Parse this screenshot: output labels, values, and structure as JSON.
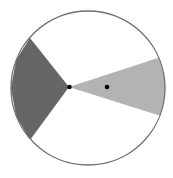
{
  "diagram": {
    "type": "circle-with-shaded-sectors",
    "colors": {
      "background": "#ffffff",
      "circle_stroke": "#6e6e6e",
      "dark_sector": "#666666",
      "light_sector": "#b3b3b3",
      "points": "#000000"
    },
    "circle": {
      "cx": 88,
      "cy": 88,
      "r": 77
    },
    "dark_sector": {
      "points": "69,87 30,38 16,60 11,88 16,116 30,140"
    },
    "light_sector": {
      "points": "69,87 164,56 166,75 166,98 164,117"
    },
    "points": [
      {
        "name": "vertex-point",
        "cx": 69.5,
        "cy": 87,
        "r": 2.3
      },
      {
        "name": "interior-point",
        "cx": 107,
        "cy": 87,
        "r": 2.3
      }
    ]
  }
}
